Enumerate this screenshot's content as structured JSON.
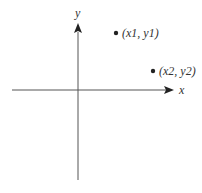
{
  "diagram": {
    "type": "cartesian-plane",
    "axes": {
      "x_label": "x",
      "y_label": "y"
    },
    "points": [
      {
        "label": "(x1, y1)"
      },
      {
        "label": "(x2, y2)"
      }
    ],
    "colors": {
      "axis": "#555555",
      "arrow": "#222222",
      "point": "#222222",
      "text": "#333333",
      "background": "#ffffff"
    }
  }
}
